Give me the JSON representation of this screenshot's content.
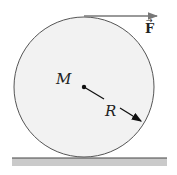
{
  "diagram": {
    "title": "",
    "labels": {
      "mass": "M",
      "radius": "R",
      "force": "F",
      "force_vector_mark": "→"
    },
    "colors": {
      "disk_fill": "#f1f1f1",
      "disk_stroke": "#555555",
      "ground_fill": "#c9c9c9",
      "ground_line": "#444444",
      "arrow": "#777777",
      "radius_arrow": "#111111"
    }
  }
}
